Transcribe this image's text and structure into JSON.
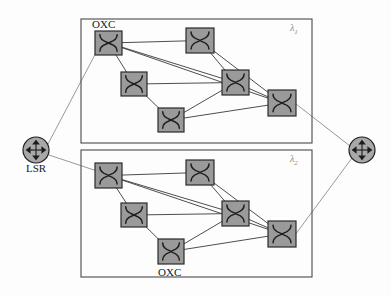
{
  "figure": {
    "background_color": "#fdfdfd",
    "width": 391,
    "height": 297
  },
  "colors": {
    "node_fill": "#9a9a9a",
    "node_stroke": "#2b2b2b",
    "link_stroke": "#3a3a3a",
    "external_link_stroke": "#8d8d8d",
    "plane_border": "#4a4a4a",
    "lsr_fill": "#a8a8a8",
    "label_color": "#1a1a1a",
    "lambda_color": "#8a8a8a"
  },
  "labels": {
    "oxc_top": "OXC",
    "oxc_bottom": "OXC",
    "lsr": "LSR",
    "lambda_1_symbol": "λ",
    "lambda_1_sub": "1",
    "lambda_2_symbol": "λ",
    "lambda_2_sub": "2"
  },
  "planes": [
    {
      "id": "plane-lambda-1",
      "name": "wavelength-plane-lambda-1",
      "lambda_label": "λ1",
      "box": {
        "x": 81,
        "y": 19,
        "width": 231,
        "height": 124
      },
      "nodes": [
        {
          "id": "u1",
          "name": "oxc-node-u1",
          "x": 95,
          "y": 31,
          "w": 27,
          "h": 24
        },
        {
          "id": "u2",
          "name": "oxc-node-u2",
          "x": 186,
          "y": 28,
          "w": 28,
          "h": 25
        },
        {
          "id": "u3",
          "name": "oxc-node-u3",
          "x": 121,
          "y": 72,
          "w": 26,
          "h": 24
        },
        {
          "id": "u4",
          "name": "oxc-node-u4",
          "x": 222,
          "y": 70,
          "w": 27,
          "h": 25
        },
        {
          "id": "u5",
          "name": "oxc-node-u5",
          "x": 158,
          "y": 108,
          "w": 26,
          "h": 24
        },
        {
          "id": "u6",
          "name": "oxc-node-u6",
          "x": 268,
          "y": 90,
          "w": 28,
          "h": 26
        }
      ],
      "links": [
        {
          "from": "u1",
          "to": "u2"
        },
        {
          "from": "u1",
          "to": "u3"
        },
        {
          "from": "u1",
          "to": "u4"
        },
        {
          "from": "u1",
          "to": "u6"
        },
        {
          "from": "u2",
          "to": "u4"
        },
        {
          "from": "u2",
          "to": "u6"
        },
        {
          "from": "u3",
          "to": "u4"
        },
        {
          "from": "u3",
          "to": "u5"
        },
        {
          "from": "u4",
          "to": "u5"
        },
        {
          "from": "u4",
          "to": "u6"
        },
        {
          "from": "u5",
          "to": "u6"
        }
      ]
    },
    {
      "id": "plane-lambda-2",
      "name": "wavelength-plane-lambda-2",
      "lambda_label": "λ2",
      "box": {
        "x": 81,
        "y": 150,
        "width": 231,
        "height": 127
      },
      "nodes": [
        {
          "id": "d1",
          "name": "oxc-node-d1",
          "x": 95,
          "y": 163,
          "w": 27,
          "h": 25
        },
        {
          "id": "d2",
          "name": "oxc-node-d2",
          "x": 186,
          "y": 160,
          "w": 28,
          "h": 25
        },
        {
          "id": "d3",
          "name": "oxc-node-d3",
          "x": 121,
          "y": 203,
          "w": 26,
          "h": 24
        },
        {
          "id": "d4",
          "name": "oxc-node-d4",
          "x": 222,
          "y": 201,
          "w": 27,
          "h": 25
        },
        {
          "id": "d5",
          "name": "oxc-node-d5",
          "x": 158,
          "y": 239,
          "w": 26,
          "h": 25
        },
        {
          "id": "d6",
          "name": "oxc-node-d6",
          "x": 268,
          "y": 221,
          "w": 28,
          "h": 26
        }
      ],
      "links": [
        {
          "from": "d1",
          "to": "d2"
        },
        {
          "from": "d1",
          "to": "d3"
        },
        {
          "from": "d1",
          "to": "d4"
        },
        {
          "from": "d1",
          "to": "d6"
        },
        {
          "from": "d2",
          "to": "d4"
        },
        {
          "from": "d2",
          "to": "d6"
        },
        {
          "from": "d3",
          "to": "d4"
        },
        {
          "from": "d3",
          "to": "d5"
        },
        {
          "from": "d4",
          "to": "d5"
        },
        {
          "from": "d4",
          "to": "d6"
        },
        {
          "from": "d5",
          "to": "d6"
        }
      ]
    }
  ],
  "lsr_nodes": [
    {
      "id": "lsr-left",
      "name": "lsr-node-left",
      "cx": 36,
      "cy": 150,
      "r": 13,
      "label": "LSR"
    },
    {
      "id": "lsr-right",
      "name": "lsr-node-right",
      "cx": 362,
      "cy": 150,
      "r": 13,
      "label": ""
    }
  ],
  "external_links": [
    {
      "name": "lsr-left-to-plane1",
      "x1": 48,
      "y1": 144,
      "x2": 99,
      "y2": 47
    },
    {
      "name": "lsr-left-to-plane2",
      "x1": 49,
      "y1": 155,
      "x2": 100,
      "y2": 172
    },
    {
      "name": "plane1-to-lsr-right",
      "x1": 296,
      "y1": 104,
      "x2": 350,
      "y2": 146
    },
    {
      "name": "plane2-to-lsr-right",
      "x1": 295,
      "y1": 235,
      "x2": 352,
      "y2": 158
    }
  ]
}
